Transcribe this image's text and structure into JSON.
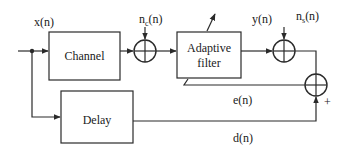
{
  "diagram": {
    "type": "block-diagram",
    "blocks": {
      "channel": {
        "label": "Channel"
      },
      "adaptive_filter": {
        "label_line1": "Adaptive",
        "label_line2": "filter"
      },
      "delay": {
        "label": "Delay"
      }
    },
    "signals": {
      "input": {
        "label": "x(n)"
      },
      "channel_noise": {
        "base": "n",
        "subscript": "c",
        "suffix": "(n)"
      },
      "filter_output": {
        "label": "y(n)"
      },
      "sensor_noise": {
        "base": "n",
        "subscript": "s",
        "suffix": "(n)"
      },
      "error": {
        "label": "e(n)"
      },
      "desired": {
        "label": "d(n)"
      }
    },
    "summing_junctions": [
      {
        "id": "sum1",
        "inputs": [
          "channel output",
          "n_c(n)"
        ]
      },
      {
        "id": "sum2",
        "inputs": [
          "y(n)",
          "n_s(n)"
        ]
      },
      {
        "id": "sum3",
        "inputs": [
          "sum2 output",
          "d(n)"
        ],
        "sign": "+"
      }
    ],
    "sign_label": "+"
  }
}
